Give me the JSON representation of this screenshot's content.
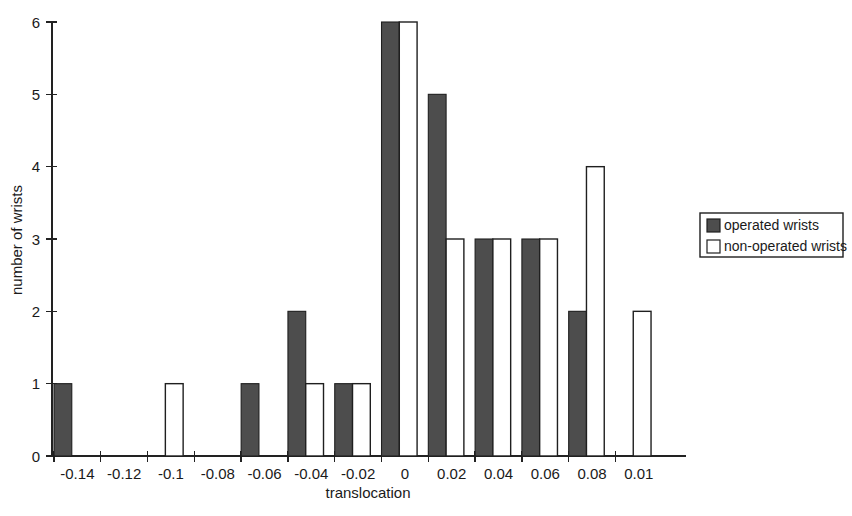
{
  "chart_data": {
    "type": "bar",
    "title": "",
    "subtitle": "",
    "xlabel": "translocation",
    "ylabel": "number of wrists",
    "categories": [
      "-0.14",
      "-0.12",
      "-0.1",
      "-0.08",
      "-0.06",
      "-0.04",
      "-0.02",
      "0",
      "0.02",
      "0.04",
      "0.06",
      "0.08",
      "0.01"
    ],
    "series": [
      {
        "name": "operated wrists",
        "color": "#4d4d4d",
        "values": [
          1,
          0,
          0,
          0,
          1,
          2,
          1,
          6,
          5,
          3,
          3,
          2,
          0
        ]
      },
      {
        "name": "non-operated wrists",
        "color": "#ffffff",
        "values": [
          0,
          0,
          1,
          0,
          0,
          1,
          1,
          6,
          3,
          3,
          3,
          4,
          2
        ]
      }
    ],
    "ylim": [
      0,
      6
    ],
    "yticks": [
      0,
      1,
      2,
      3,
      4,
      5,
      6
    ],
    "ytick_labels": [
      "0",
      "1",
      "2",
      "3",
      "4",
      "5",
      "6"
    ],
    "grid": false,
    "legend_position": "right"
  },
  "legend": {
    "entries": [
      {
        "label": "operated wrists",
        "swatch": "dark-square-swatch"
      },
      {
        "label": "non-operated wrists",
        "swatch": "light-square-swatch"
      }
    ]
  },
  "axes": {
    "x_title": "translocation",
    "y_title": "number of wrists"
  }
}
